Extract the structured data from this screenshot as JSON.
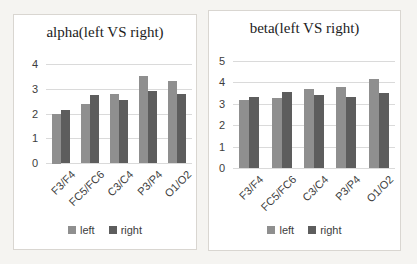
{
  "page": {
    "background_color": "#f5f4f1",
    "panel_background": "#ffffff",
    "panel_border_color": "#d9d6d1",
    "gridline_color": "#dadada",
    "text_color": "#3d3d3d"
  },
  "chart_data": [
    {
      "type": "bar",
      "title": "alpha(left VS right)",
      "categories": [
        "F3/F4",
        "FC5/FC6",
        "C3/C4",
        "P3/P4",
        "O1/O2"
      ],
      "series": [
        {
          "name": "left",
          "color": "#8f8f8f",
          "values": [
            2.0,
            2.4,
            2.8,
            3.5,
            3.3
          ]
        },
        {
          "name": "right",
          "color": "#5d5d5d",
          "values": [
            2.15,
            2.75,
            2.55,
            2.9,
            2.8
          ]
        }
      ],
      "xlabel": "",
      "ylabel": "",
      "ylim": [
        0,
        4
      ],
      "yticks": [
        0,
        1,
        2,
        3,
        4
      ],
      "grid": true,
      "legend_position": "bottom"
    },
    {
      "type": "bar",
      "title": "beta(left VS right)",
      "categories": [
        "F3/F4",
        "FC5/FC6",
        "C3/C4",
        "P3/P4",
        "O1/O2"
      ],
      "series": [
        {
          "name": "left",
          "color": "#8f8f8f",
          "values": [
            3.2,
            3.25,
            3.7,
            3.8,
            4.15
          ]
        },
        {
          "name": "right",
          "color": "#5d5d5d",
          "values": [
            3.3,
            3.55,
            3.4,
            3.3,
            3.5
          ]
        }
      ],
      "xlabel": "",
      "ylabel": "",
      "ylim": [
        0,
        5
      ],
      "yticks": [
        0,
        1,
        2,
        3,
        4,
        5
      ],
      "grid": true,
      "legend_position": "bottom"
    }
  ]
}
